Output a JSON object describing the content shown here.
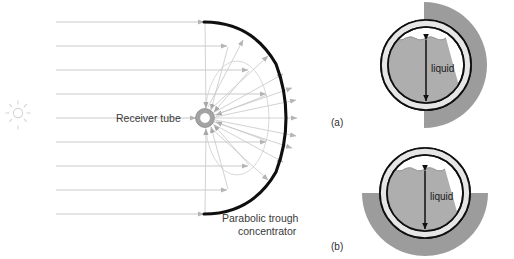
{
  "figure": {
    "left_panel": {
      "sun_icon": "sun-icon",
      "receiver_label": "Receiver tube",
      "concentrator_label_line1": "Parabolic trough",
      "concentrator_label_line2": "concentrator",
      "incoming_ray_count": 9,
      "reflected_ray_count": 18
    },
    "right_panel": {
      "diagrams": [
        {
          "caption": "(a)",
          "liquid_label": "liquid",
          "reflector_side": "right",
          "fill_level_fraction": 0.82
        },
        {
          "caption": "(b)",
          "liquid_label": "liquid",
          "reflector_side": "bottom",
          "fill_level_fraction": 0.78
        }
      ]
    },
    "colors": {
      "parabola": "#111111",
      "ray": "#b9b9b9",
      "reflected_ray": "#c4c4c4",
      "sun": "#d8d8d8",
      "receiver_outer": "#9a9a9a",
      "receiver_inner": "#ffffff",
      "tube_wall": "#111111",
      "annulus_fill": "#e3e3e3",
      "liquid_fill": "#aeaeae",
      "reflector": "#9a9a9a",
      "text": "#3a3a3a",
      "background": "#ffffff"
    }
  }
}
